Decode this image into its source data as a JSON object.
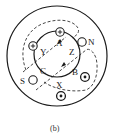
{
  "diagram": {
    "caption": "(b)",
    "outer_circle": {
      "cx": 57,
      "cy": 56,
      "r": 50
    },
    "inner_circle": {
      "cx": 57,
      "cy": 54,
      "r": 23
    },
    "conductors": [
      {
        "name": "A-slot",
        "cx": 60,
        "cy": 32,
        "mark": "plus"
      },
      {
        "name": "Y-slot",
        "cx": 33,
        "cy": 46,
        "mark": "plus"
      },
      {
        "name": "N-slot",
        "cx": 82,
        "cy": 42,
        "mark": "none"
      },
      {
        "name": "S-slot",
        "cx": 33,
        "cy": 80,
        "mark": "none"
      },
      {
        "name": "B-slot",
        "cx": 85,
        "cy": 77,
        "mark": "dot"
      },
      {
        "name": "X-slot",
        "cx": 61,
        "cy": 96,
        "mark": "dot"
      }
    ],
    "labels": {
      "A": "A",
      "Y": "Y",
      "Z": "Z",
      "B": "B",
      "C": "C",
      "X": "X",
      "N": "N",
      "S": "S"
    },
    "colors": {
      "stroke": "#1a1a1a",
      "background": "#ffffff"
    }
  }
}
